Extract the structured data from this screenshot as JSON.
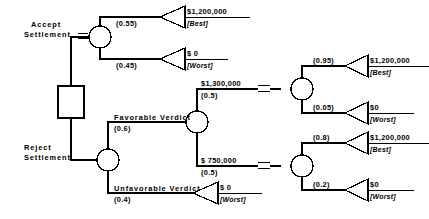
{
  "diagram": {
    "type": "decision-tree",
    "title": "",
    "decision_node": {
      "shape": "square",
      "label": ""
    },
    "alternatives": [
      {
        "id": "accept",
        "label_line1": "Accept",
        "label_line2": "Settlement",
        "pruned_mark": "//",
        "outcomes": [
          {
            "probability": "(0.55)",
            "payoff": "$1,200,000",
            "tag": "[Best]"
          },
          {
            "probability": "(0.45)",
            "payoff": "$ 0",
            "tag": "[Worst]"
          }
        ]
      },
      {
        "id": "reject",
        "label_line1": "Reject",
        "label_line2": "Settlement",
        "pruned_mark": "",
        "events": [
          {
            "id": "favorable",
            "label": "Favorable  Verdict",
            "probability": "(0.6)",
            "sub_events": [
              {
                "id": "award-1300000",
                "payoff": "$1,300,000",
                "probability": "(0.5)",
                "pruned_mark": "//",
                "outcomes": [
                  {
                    "probability": "(0.95)",
                    "payoff": "$1,200,000",
                    "tag": "[Best]"
                  },
                  {
                    "probability": "(0.05)",
                    "payoff": "$0",
                    "tag": "[Worst]"
                  }
                ]
              },
              {
                "id": "award-750000",
                "payoff": "$ 750,000",
                "probability": "(0.5)",
                "pruned_mark": "//",
                "outcomes": [
                  {
                    "probability": "(0.8)",
                    "payoff": "$1,200,000",
                    "tag": "[Best]"
                  },
                  {
                    "probability": "(0.2)",
                    "payoff": "$0",
                    "tag": "[Worst]"
                  }
                ]
              }
            ]
          },
          {
            "id": "unfavorable",
            "label": "Unfavorable  Verdict",
            "probability": "(0.4)",
            "terminal": {
              "payoff": "$ 0",
              "tag": "[Worst]"
            }
          }
        ]
      }
    ],
    "colors": {
      "stroke": "#000000",
      "fill": "#ffffff",
      "background": "#ffffff"
    }
  }
}
